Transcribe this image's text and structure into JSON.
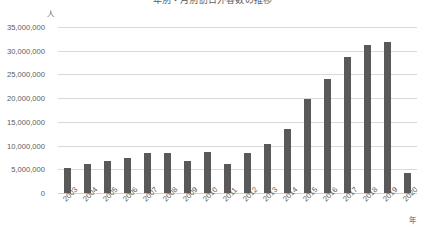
{
  "chart_data": {
    "type": "bar",
    "title": "年別・月別訪日外客数の推移",
    "xlabel": "年",
    "ylabel": "人",
    "categories": [
      "2003",
      "2004",
      "2005",
      "2006",
      "2007",
      "2008",
      "2009",
      "2010",
      "2011",
      "2012",
      "2013",
      "2014",
      "2015",
      "2016",
      "2017",
      "2018",
      "2019",
      "2020"
    ],
    "values": [
      5211725,
      6137905,
      6727926,
      7334077,
      8346969,
      8350835,
      6789658,
      8611175,
      6218752,
      8358105,
      10363904,
      13413467,
      19737409,
      24039700,
      28691073,
      31191856,
      31882049,
      4115828
    ],
    "series": [
      {
        "name": "訪日外客数",
        "values": [
          5211725,
          6137905,
          6727926,
          7334077,
          8346969,
          8350835,
          6789658,
          8611175,
          6218752,
          8358105,
          10363904,
          13413467,
          19737409,
          24039700,
          28691073,
          31191856,
          31882049,
          4115828
        ]
      }
    ],
    "ylim": [
      0,
      35000000
    ],
    "ytick_values": [
      0,
      5000000,
      10000000,
      15000000,
      20000000,
      25000000,
      30000000,
      35000000
    ],
    "ytick_labels": [
      "0",
      "5,000,000",
      "10,000,000",
      "15,000,000",
      "20,000,000",
      "25,000,000",
      "30,000,000",
      "35,000,000"
    ],
    "grid": true,
    "legend": false,
    "legend_position": "none",
    "bar_color": "#595959",
    "gridline_color": "#d9d9d9",
    "background_color": "#ffffff",
    "text_color": "#595959",
    "xtick_rotation": -45
  }
}
